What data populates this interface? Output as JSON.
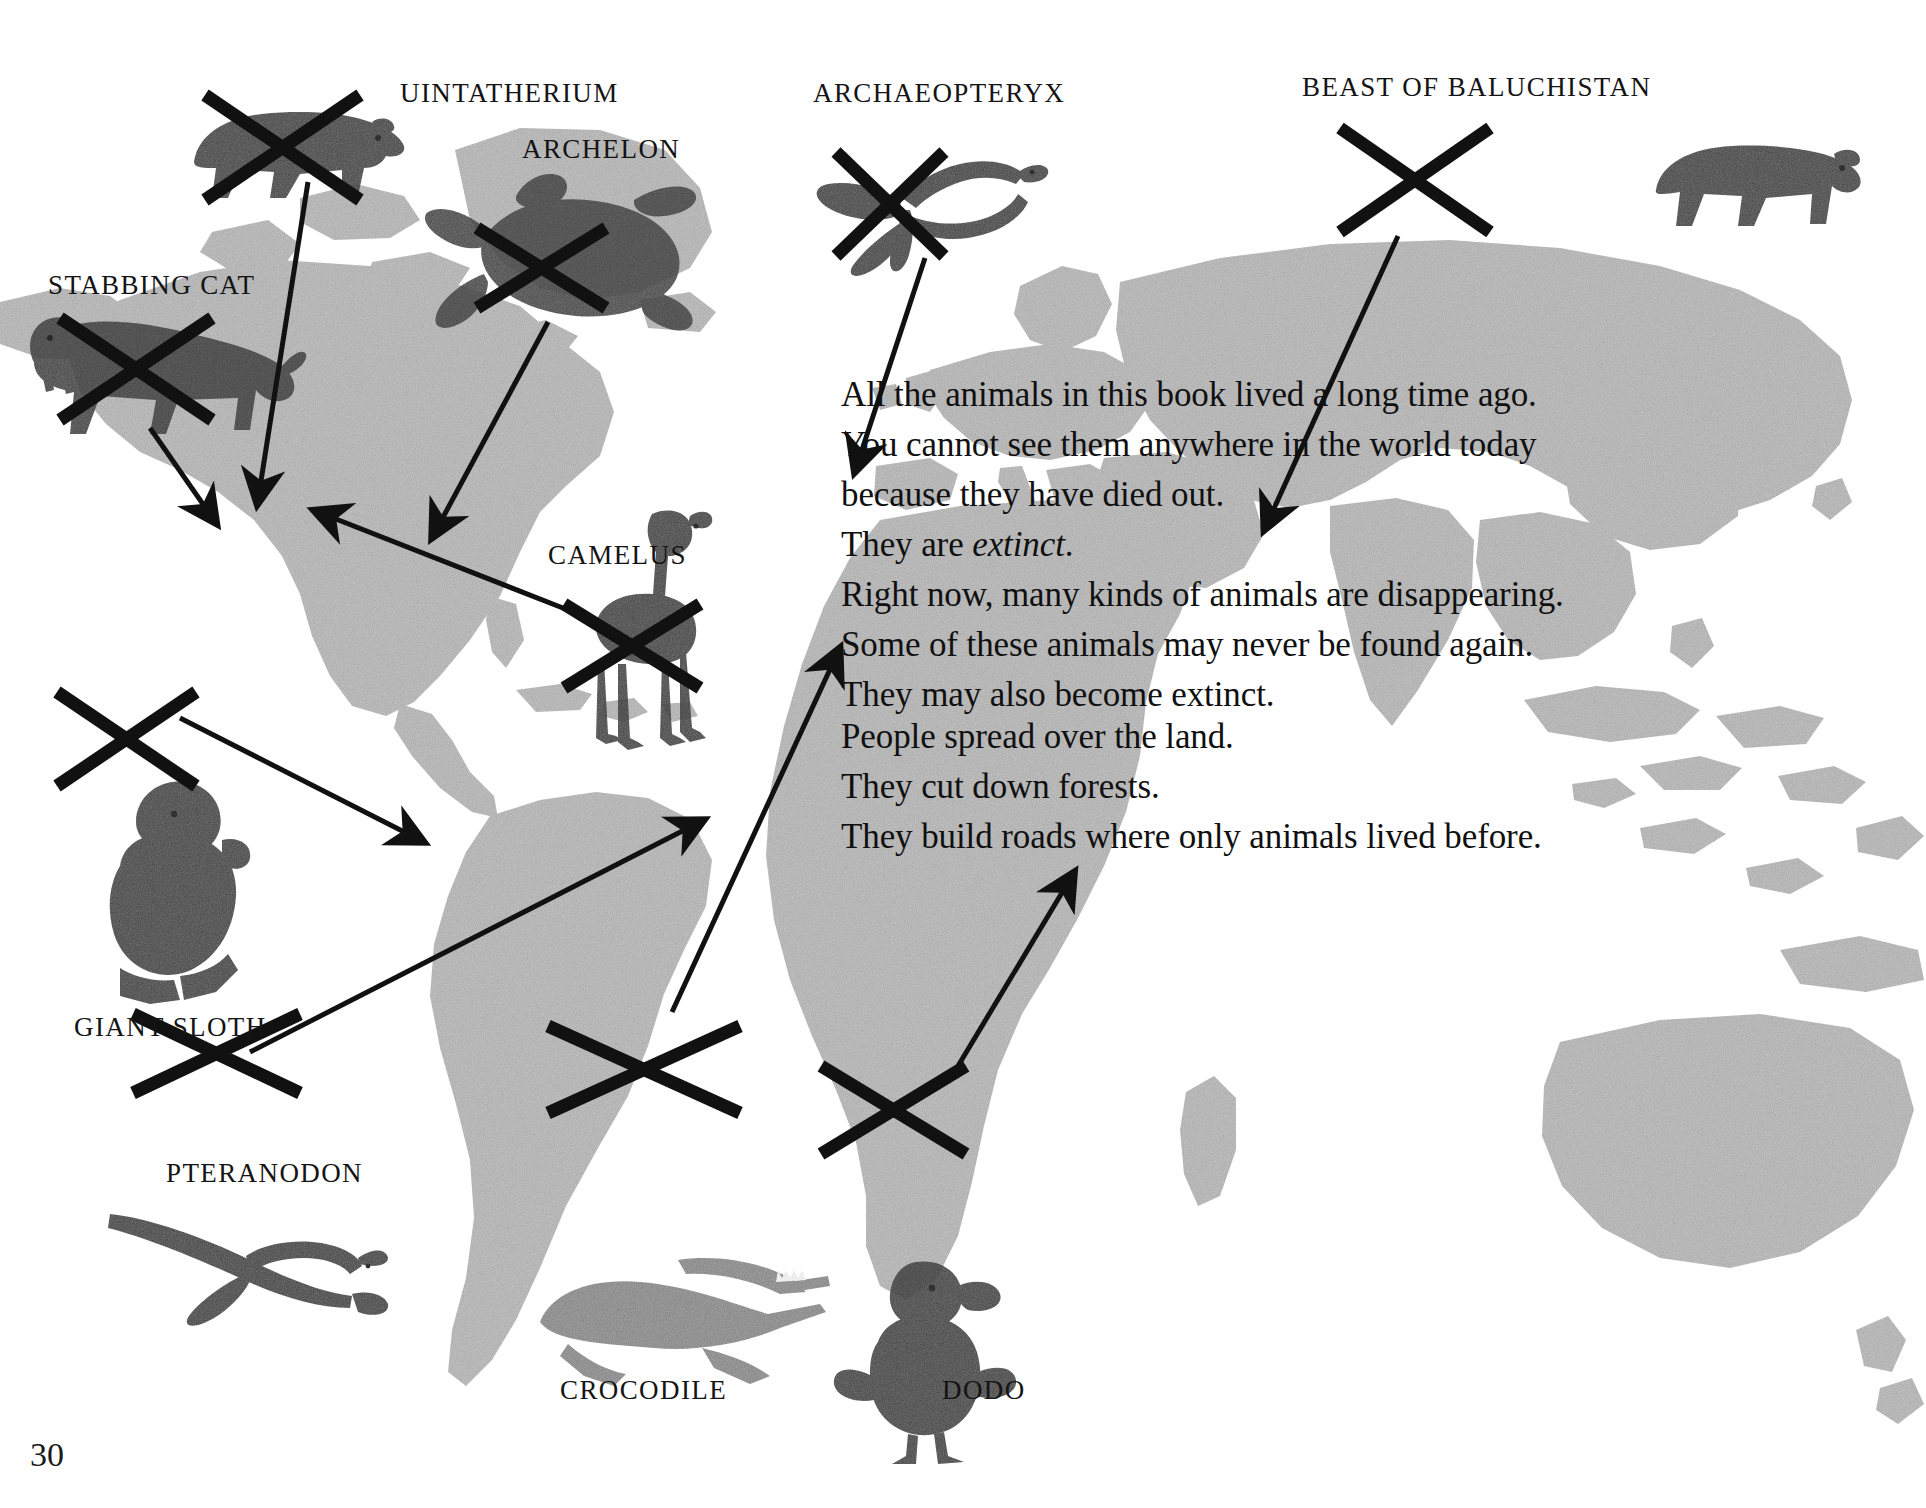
{
  "page": {
    "folio": "30",
    "background_color": "#ffffff",
    "land_color": "#b4b4b4",
    "ink_color": "#111111"
  },
  "body_text": {
    "block_1": [
      "All the animals in this book lived a long time ago.",
      "You cannot see them anywhere in the world today",
      "because they have died out.",
      "They are extinct.",
      "Right now, many kinds of animals are disappearing.",
      "Some of these animals may never be found again.",
      "They may also become extinct."
    ],
    "block_1_italic_word": "extinct",
    "block_2": [
      "People spread over the land.",
      "They cut down forests.",
      "They build roads where only animals lived before."
    ]
  },
  "specimens": [
    {
      "id": "uintatherium",
      "label": "UINTATHERIUM",
      "crossed_out": true
    },
    {
      "id": "archelon",
      "label": "ARCHELON",
      "crossed_out": true
    },
    {
      "id": "archaeopteryx",
      "label": "ARCHAEOPTERYX",
      "crossed_out": true
    },
    {
      "id": "beast-of-baluchistan",
      "label": "BEAST OF BALUCHISTAN",
      "crossed_out": true
    },
    {
      "id": "stabbing-cat",
      "label": "STABBING CAT",
      "crossed_out": true
    },
    {
      "id": "camelus",
      "label": "CAMELUS",
      "crossed_out": true
    },
    {
      "id": "giant-sloth",
      "label": "GIANT SLOTH",
      "crossed_out": true
    },
    {
      "id": "pteranodon",
      "label": "PTERANODON",
      "crossed_out": true
    },
    {
      "id": "crocodile",
      "label": "CROCODILE",
      "crossed_out": true
    },
    {
      "id": "dodo",
      "label": "DODO",
      "crossed_out": true
    }
  ]
}
